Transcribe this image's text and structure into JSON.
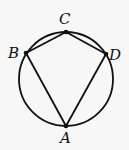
{
  "diagram": {
    "type": "inscribed-quadrilateral",
    "circle": {
      "cx": 66,
      "cy": 79,
      "r": 47
    },
    "points": [
      {
        "name": "A",
        "x": 66,
        "y": 126,
        "label_x": 60,
        "label_y": 143
      },
      {
        "name": "B",
        "x": 26,
        "y": 53,
        "label_x": 8,
        "label_y": 58
      },
      {
        "name": "C",
        "x": 66,
        "y": 32,
        "label_x": 59,
        "label_y": 24
      },
      {
        "name": "D",
        "x": 106,
        "y": 54,
        "label_x": 109,
        "label_y": 60
      }
    ],
    "segments": [
      [
        "A",
        "B"
      ],
      [
        "B",
        "C"
      ],
      [
        "C",
        "D"
      ],
      [
        "D",
        "A"
      ]
    ],
    "stroke_color": "#111111",
    "background": "#f7f7f7"
  }
}
